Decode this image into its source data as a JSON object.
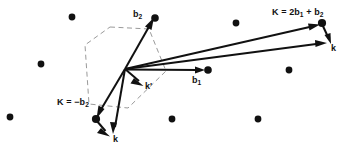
{
  "figure": {
    "background_color": "#ffffff",
    "ink_color": "#111111",
    "bz_color": "#9a9a9a",
    "width": 345,
    "height": 147
  },
  "labels": {
    "b2": "b",
    "b2_sub": "2",
    "b1": "b",
    "b1_sub": "1",
    "k_right": "k",
    "k_bottom": "k",
    "k_prime": "k'",
    "K_upper_pre": "K = 2b",
    "K_upper_sub1": "1",
    "K_upper_mid": " + b",
    "K_upper_sub2": "2",
    "K_lower_pre": "K = −b",
    "K_lower_sub": "2"
  },
  "geometry": {
    "origin": [
      125,
      69
    ],
    "brillouin_zone_vertices": [
      [
        110,
        27
      ],
      [
        149,
        29
      ],
      [
        166,
        71
      ],
      [
        128,
        108
      ],
      [
        89,
        104
      ],
      [
        85,
        45
      ]
    ],
    "lattice_dots": [
      {
        "cx": 72,
        "cy": 17,
        "r": 3.4
      },
      {
        "cx": 41,
        "cy": 64,
        "r": 3.4
      },
      {
        "cx": 10,
        "cy": 117,
        "r": 3.4
      },
      {
        "cx": 155,
        "cy": 18,
        "r": 3.6
      },
      {
        "cx": 172,
        "cy": 119,
        "r": 3.4
      },
      {
        "cx": 208,
        "cy": 70,
        "r": 3.6
      },
      {
        "cx": 236,
        "cy": 23,
        "r": 3.4
      },
      {
        "cx": 258,
        "cy": 119,
        "r": 3.4
      },
      {
        "cx": 289,
        "cy": 70,
        "r": 3.4
      },
      {
        "cx": 322,
        "cy": 23,
        "r": 4.0
      },
      {
        "cx": 96,
        "cy": 119,
        "r": 4.0
      }
    ],
    "vectors": [
      {
        "name": "b2",
        "from": [
          125,
          69
        ],
        "to": [
          152,
          21
        ]
      },
      {
        "name": "b1",
        "from": [
          125,
          69
        ],
        "to": [
          204,
          70
        ]
      },
      {
        "name": "k-prime",
        "from": [
          125,
          69
        ],
        "to": [
          142,
          85
        ]
      },
      {
        "name": "k-incident-right",
        "from": [
          125,
          69
        ],
        "to": [
          326,
          43
        ]
      },
      {
        "name": "K-upper",
        "from": [
          125,
          69
        ],
        "to": [
          319,
          25
        ]
      },
      {
        "name": "K-upper-closure",
        "from": [
          322,
          24
        ],
        "to": [
          330,
          43
        ]
      },
      {
        "name": "k-scattered-bottom",
        "from": [
          125,
          69
        ],
        "to": [
          113,
          134
        ]
      },
      {
        "name": "K-lower",
        "from": [
          125,
          69
        ],
        "to": [
          98,
          116
        ]
      },
      {
        "name": "K-lower-closure",
        "from": [
          96,
          120
        ],
        "to": [
          109,
          136
        ]
      }
    ]
  }
}
